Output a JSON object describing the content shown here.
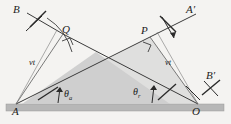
{
  "figure": {
    "type": "geometry-diagram",
    "background_color": "#f4f3f1",
    "line_color": "#3a3a3a",
    "ground_color": "#b9b9b9",
    "shade_color": "#cfcfcf"
  },
  "points": {
    "A": "A",
    "O": "O",
    "Q": "Q",
    "P": "P",
    "B": "B",
    "A_prime": "A′",
    "B_prime": "B′"
  },
  "distance_labels": {
    "left": "vt",
    "right": "vt"
  },
  "angles": {
    "incidence": {
      "symbol": "θ",
      "subscript": "a"
    },
    "reflection": {
      "symbol": "θ",
      "subscript": "r"
    }
  },
  "markers": {
    "right_angle_at_Q": "right-angle",
    "right_angle_at_P": "right-angle",
    "wavefront_ticks": 4,
    "direction_arrows": 2
  },
  "geometry": {
    "A": [
      16,
      104
    ],
    "O": [
      198,
      104
    ],
    "Q": [
      63,
      34
    ],
    "P": [
      150,
      37
    ],
    "ray_B_end": [
      28,
      13
    ],
    "ray_A_prime_end": [
      196,
      13
    ],
    "ray_B_prime_end": [
      222,
      80
    ],
    "baseline_y": 104,
    "ground_thickness": 7
  }
}
